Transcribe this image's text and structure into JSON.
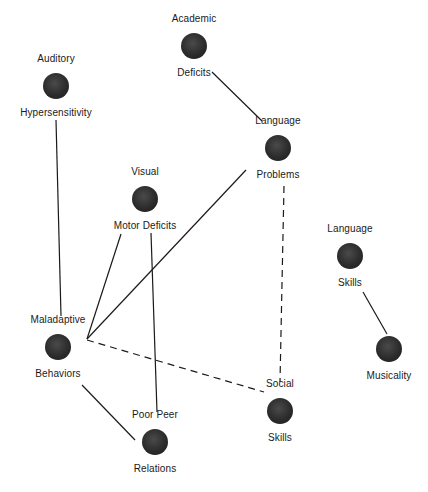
{
  "diagram": {
    "type": "concept-network",
    "colors": {
      "node": "#2e2e2e",
      "edge": "#1a1a1a",
      "text": "#1a1a1a",
      "background": "#ffffff"
    },
    "nodes": [
      {
        "id": "academic",
        "top_label": "Academic",
        "bottom_label": "Deficits",
        "cx": 194,
        "cy": 46
      },
      {
        "id": "auditory",
        "top_label": "Auditory",
        "bottom_label": "Hypersensitivity",
        "cx": 56,
        "cy": 86
      },
      {
        "id": "language_problems",
        "top_label": "Language",
        "bottom_label": "Problems",
        "cx": 278,
        "cy": 148
      },
      {
        "id": "visual",
        "top_label": "Visual",
        "bottom_label": "Motor Deficits",
        "cx": 145,
        "cy": 199
      },
      {
        "id": "language_skills",
        "top_label": "Language",
        "bottom_label": "Skills",
        "cx": 350,
        "cy": 256
      },
      {
        "id": "maladaptive",
        "top_label": "Maladaptive",
        "bottom_label": "Behaviors",
        "cx": 58,
        "cy": 347
      },
      {
        "id": "musicality",
        "top_label": "",
        "bottom_label": "Musicality",
        "cx": 389,
        "cy": 349
      },
      {
        "id": "social",
        "top_label": "Social",
        "bottom_label": "Skills",
        "cx": 280,
        "cy": 411
      },
      {
        "id": "poor_peer",
        "top_label": "Poor Peer",
        "bottom_label": "Relations",
        "cx": 155,
        "cy": 442
      }
    ],
    "edges": [
      {
        "from": "academic",
        "to": "language_problems",
        "style": "solid",
        "x1": 212,
        "y1": 72,
        "x2": 262,
        "y2": 121
      },
      {
        "from": "auditory",
        "to": "maladaptive",
        "style": "solid",
        "x1": 56,
        "y1": 120,
        "x2": 61,
        "y2": 316
      },
      {
        "from": "language_problems",
        "to": "maladaptive",
        "style": "solid",
        "x1": 246,
        "y1": 170,
        "x2": 87,
        "y2": 339
      },
      {
        "from": "visual",
        "to": "maladaptive",
        "style": "solid",
        "x1": 121,
        "y1": 234,
        "x2": 87,
        "y2": 339
      },
      {
        "from": "visual",
        "to": "poor_peer",
        "style": "solid",
        "x1": 151,
        "y1": 233,
        "x2": 157,
        "y2": 412
      },
      {
        "from": "language_problems",
        "to": "social",
        "style": "dashed",
        "x1": 284,
        "y1": 186,
        "x2": 280,
        "y2": 382
      },
      {
        "from": "maladaptive",
        "to": "social",
        "style": "dashed",
        "x1": 87,
        "y1": 340,
        "x2": 264,
        "y2": 392
      },
      {
        "from": "maladaptive",
        "to": "poor_peer",
        "style": "solid",
        "x1": 82,
        "y1": 385,
        "x2": 135,
        "y2": 440
      },
      {
        "from": "language_skills",
        "to": "musicality",
        "style": "solid",
        "x1": 363,
        "y1": 292,
        "x2": 387,
        "y2": 334
      }
    ]
  }
}
